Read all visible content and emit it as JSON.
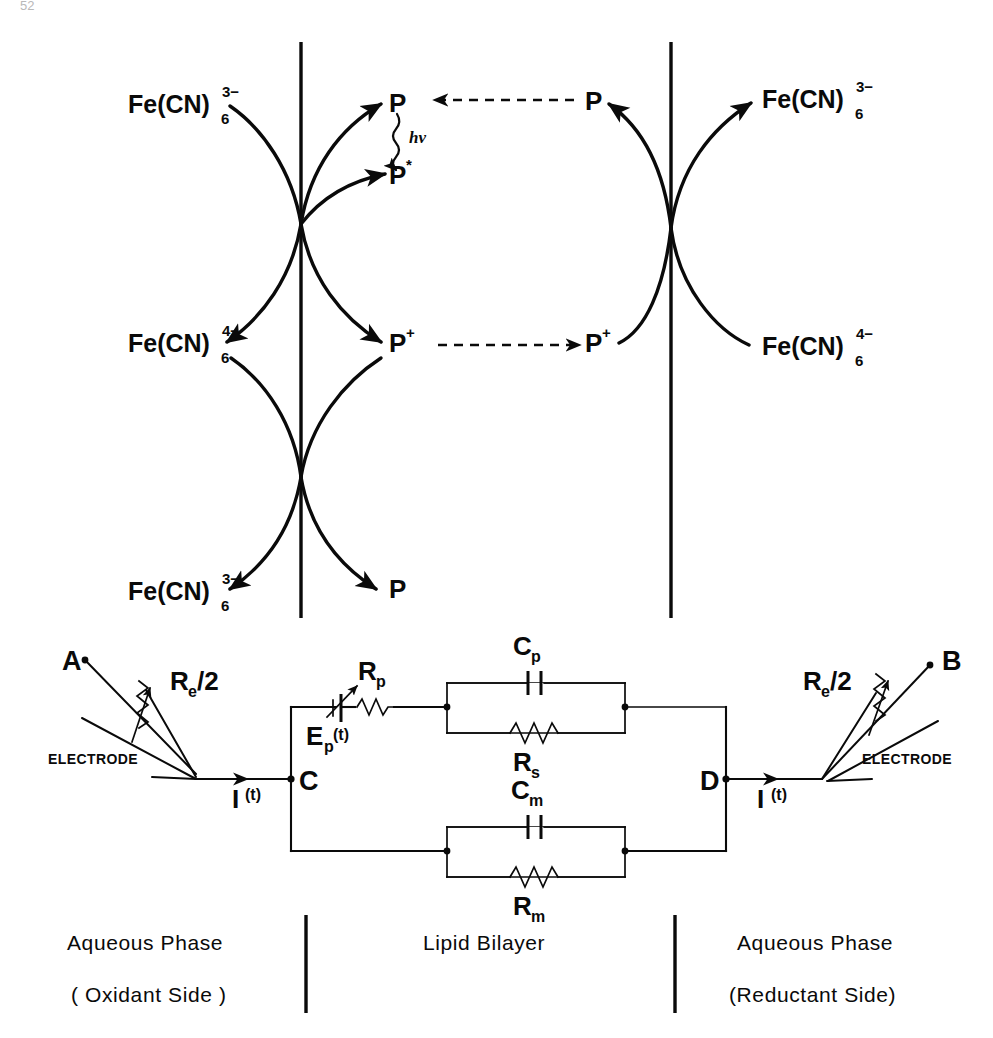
{
  "page": {
    "number_fragment": "52"
  },
  "top_scheme": {
    "label": "photoredox-cycle-scheme",
    "bilayer_left_boundary": "membrane-interface-left",
    "bilayer_right_boundary": "membrane-interface-right",
    "cycles": [
      {
        "id": "upper-left-cycle",
        "left_species": {
          "base": "Fe(CN)",
          "sub": "6",
          "sup": "3−"
        },
        "right_species_in": {
          "base": "P",
          "sup": ""
        },
        "right_species_out": {
          "base": "P",
          "sup": "*"
        },
        "excitation_label": "hν"
      },
      {
        "id": "middle-left-cycle",
        "left_species": {
          "base": "Fe(CN)",
          "sub": "6",
          "sup": "4−"
        },
        "right_species": {
          "base": "P",
          "sup": "+"
        }
      },
      {
        "id": "lower-left-cycle",
        "left_species": {
          "base": "Fe(CN)",
          "sub": "6",
          "sup": "3−"
        },
        "right_species": {
          "base": "P",
          "sup": ""
        }
      },
      {
        "id": "upper-right-cycle",
        "left_species": {
          "base": "P",
          "sup": ""
        },
        "right_species": {
          "base": "Fe(CN)",
          "sub": "6",
          "sup": "3−"
        }
      },
      {
        "id": "lower-right-cycle",
        "left_species": {
          "base": "P",
          "sup": "+"
        },
        "right_species": {
          "base": "Fe(CN)",
          "sub": "6",
          "sup": "4−"
        }
      }
    ],
    "transport_arrows": [
      {
        "id": "p-transport-arrow",
        "from": "P",
        "to": "P",
        "style": "dashed",
        "direction": "right-to-left"
      },
      {
        "id": "p-plus-transport-arrow",
        "from": "P⁺",
        "to": "P⁺",
        "style": "dashed",
        "direction": "left-to-right"
      }
    ]
  },
  "circuit": {
    "label": "equivalent-circuit",
    "terminal_a": "A",
    "terminal_b": "B",
    "node_c": "C",
    "node_d": "D",
    "electrode_left_label": "ELECTRODE",
    "electrode_right_label": "ELECTRODE",
    "electrode_resistance_left": {
      "base": "R",
      "sub": "e",
      "suffix": "/2"
    },
    "electrode_resistance_right": {
      "base": "R",
      "sub": "e",
      "suffix": "/2"
    },
    "current_left": {
      "base": "I",
      "sup": "(t)"
    },
    "current_right": {
      "base": "I",
      "sup": "(t)"
    },
    "photo_emf": {
      "base": "E",
      "sub": "p",
      "sup": "(t)"
    },
    "photo_resistance": {
      "base": "R",
      "sub": "p"
    },
    "upper_branch": {
      "capacitor": {
        "base": "C",
        "sub": "p"
      },
      "resistor": {
        "base": "R",
        "sub": "s"
      }
    },
    "lower_branch": {
      "capacitor": {
        "base": "C",
        "sub": "m"
      },
      "resistor": {
        "base": "R",
        "sub": "m"
      }
    }
  },
  "captions": {
    "left": {
      "line1": "Aqueous Phase",
      "line2": "( Oxidant Side )"
    },
    "center": {
      "line1": "Lipid Bilayer",
      "line2": ""
    },
    "right": {
      "line1": "Aqueous Phase",
      "line2": "(Reductant Side)"
    }
  },
  "colors": {
    "ink": "#0a0a0a",
    "background": "#ffffff",
    "pagenum": "#b9b9b9"
  }
}
